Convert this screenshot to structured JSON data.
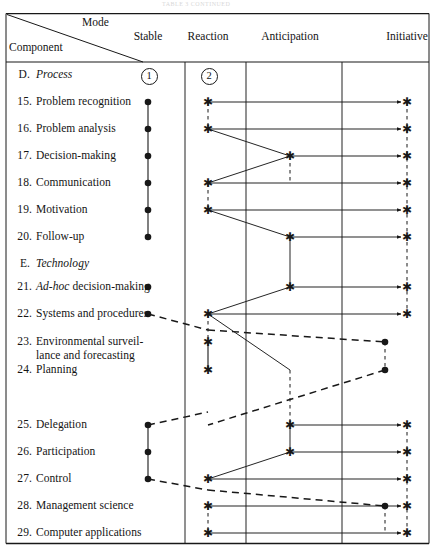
{
  "caption": "TABLE 3   CONTINUED",
  "header": {
    "mode_label": "Mode",
    "component_label": "Component",
    "columns": [
      {
        "id": "stable",
        "label": "Stable",
        "x": 148,
        "divider": 185
      },
      {
        "id": "reaction",
        "label": "Reaction",
        "x": 208,
        "divider": 246
      },
      {
        "id": "anticipation",
        "label": "Anticipation",
        "x": 290,
        "divider": 342
      },
      {
        "id": "initiative",
        "label": "Initiative",
        "x": 407,
        "divider": null
      }
    ],
    "stage_markers": [
      {
        "label": "1",
        "x": 148,
        "y": 75
      },
      {
        "label": "2",
        "x": 208,
        "y": 75
      }
    ]
  },
  "rows": [
    {
      "num": "D.",
      "label": "Process",
      "italic": true,
      "section": true,
      "y": 75
    },
    {
      "num": "15.",
      "label": "Problem recognition",
      "italic": false,
      "section": false,
      "y": 102
    },
    {
      "num": "16.",
      "label": "Problem analysis",
      "italic": false,
      "section": false,
      "y": 129
    },
    {
      "num": "17.",
      "label": "Decision-making",
      "italic": false,
      "section": false,
      "y": 156
    },
    {
      "num": "18.",
      "label": "Communication",
      "italic": false,
      "section": false,
      "y": 183
    },
    {
      "num": "19.",
      "label": "Motivation",
      "italic": false,
      "section": false,
      "y": 210
    },
    {
      "num": "20.",
      "label": "Follow-up",
      "italic": false,
      "section": false,
      "y": 237
    },
    {
      "num": "E.",
      "label": "Technology",
      "italic": true,
      "section": true,
      "y": 264
    },
    {
      "num": "21.",
      "label": "Ad-hoc decision-making",
      "italic_prefix": "Ad-hoc",
      "italic": false,
      "section": false,
      "y": 287
    },
    {
      "num": "22.",
      "label": "Systems and procedures",
      "italic": false,
      "section": false,
      "y": 314
    },
    {
      "num": "23.",
      "label": "Environmental surveil-",
      "label2": "lance and forecasting",
      "italic": false,
      "section": false,
      "y": 342
    },
    {
      "num": "24.",
      "label": "Planning",
      "italic": false,
      "section": false,
      "y": 370
    },
    {
      "num": "25.",
      "label": "Delegation",
      "italic": false,
      "section": false,
      "y": 425
    },
    {
      "num": "26.",
      "label": "Participation",
      "italic": false,
      "section": false,
      "y": 452
    },
    {
      "num": "27.",
      "label": "Control",
      "italic": false,
      "section": false,
      "y": 479
    },
    {
      "num": "28.",
      "label": "Management science",
      "italic": false,
      "section": false,
      "y": 506
    },
    {
      "num": "29.",
      "label": "Computer applications",
      "italic": false,
      "section": false,
      "y": 533
    }
  ],
  "chart_data": {
    "type": "scatter",
    "xlabel": "Mode",
    "ylabel": "Component",
    "categories_x": [
      "Stable",
      "Reaction",
      "Anticipation",
      "Initiative"
    ],
    "x_positions": [
      148,
      208,
      290,
      407
    ],
    "dot_markers": [
      {
        "row": "15.",
        "mode": "Stable",
        "x": 148,
        "y": 102
      },
      {
        "row": "16.",
        "mode": "Stable",
        "x": 148,
        "y": 129
      },
      {
        "row": "17.",
        "mode": "Stable",
        "x": 148,
        "y": 156
      },
      {
        "row": "18.",
        "mode": "Stable",
        "x": 148,
        "y": 183
      },
      {
        "row": "19.",
        "mode": "Stable",
        "x": 148,
        "y": 210
      },
      {
        "row": "20.",
        "mode": "Stable",
        "x": 148,
        "y": 237
      },
      {
        "row": "21.",
        "mode": "Stable",
        "x": 148,
        "y": 287
      },
      {
        "row": "22.",
        "mode": "Stable",
        "x": 148,
        "y": 314
      },
      {
        "row": "23.",
        "mode": "near-Initiative",
        "x": 385,
        "y": 342
      },
      {
        "row": "24.",
        "mode": "near-Initiative",
        "x": 385,
        "y": 370
      },
      {
        "row": "25.",
        "mode": "Stable",
        "x": 148,
        "y": 425
      },
      {
        "row": "26.",
        "mode": "Stable",
        "x": 148,
        "y": 452
      },
      {
        "row": "27.",
        "mode": "Stable",
        "x": 148,
        "y": 479
      },
      {
        "row": "28.",
        "mode": "near-Initiative",
        "x": 385,
        "y": 506
      }
    ],
    "star_markers": [
      {
        "row": "15.",
        "mode": "Reaction",
        "x": 208,
        "y": 102
      },
      {
        "row": "15.",
        "mode": "Initiative",
        "x": 407,
        "y": 102
      },
      {
        "row": "16.",
        "mode": "Reaction",
        "x": 208,
        "y": 129
      },
      {
        "row": "16.",
        "mode": "Initiative",
        "x": 407,
        "y": 129
      },
      {
        "row": "17.",
        "mode": "Anticipation",
        "x": 290,
        "y": 156
      },
      {
        "row": "17.",
        "mode": "Initiative",
        "x": 407,
        "y": 156
      },
      {
        "row": "18.",
        "mode": "Reaction",
        "x": 208,
        "y": 183
      },
      {
        "row": "18.",
        "mode": "Initiative",
        "x": 407,
        "y": 183
      },
      {
        "row": "19.",
        "mode": "Reaction",
        "x": 208,
        "y": 210
      },
      {
        "row": "19.",
        "mode": "Initiative",
        "x": 407,
        "y": 210
      },
      {
        "row": "20.",
        "mode": "Anticipation",
        "x": 290,
        "y": 237
      },
      {
        "row": "20.",
        "mode": "Initiative",
        "x": 407,
        "y": 237
      },
      {
        "row": "21.",
        "mode": "Anticipation",
        "x": 290,
        "y": 287
      },
      {
        "row": "21.",
        "mode": "Initiative",
        "x": 407,
        "y": 287
      },
      {
        "row": "22.",
        "mode": "Reaction",
        "x": 208,
        "y": 314
      },
      {
        "row": "22.",
        "mode": "Initiative",
        "x": 407,
        "y": 314
      },
      {
        "row": "23.",
        "mode": "Reaction",
        "x": 208,
        "y": 342
      },
      {
        "row": "24.",
        "mode": "Reaction",
        "x": 208,
        "y": 370
      },
      {
        "row": "25.",
        "mode": "Anticipation",
        "x": 290,
        "y": 425
      },
      {
        "row": "25.",
        "mode": "Initiative",
        "x": 407,
        "y": 425
      },
      {
        "row": "26.",
        "mode": "Anticipation",
        "x": 290,
        "y": 452
      },
      {
        "row": "26.",
        "mode": "Initiative",
        "x": 407,
        "y": 452
      },
      {
        "row": "27.",
        "mode": "Reaction",
        "x": 208,
        "y": 479
      },
      {
        "row": "27.",
        "mode": "Initiative",
        "x": 407,
        "y": 479
      },
      {
        "row": "28.",
        "mode": "Reaction",
        "x": 208,
        "y": 506
      },
      {
        "row": "28.",
        "mode": "Initiative",
        "x": 407,
        "y": 506
      },
      {
        "row": "29.",
        "mode": "Reaction",
        "x": 208,
        "y": 533
      },
      {
        "row": "29.",
        "mode": "Initiative",
        "x": 407,
        "y": 533
      }
    ],
    "solid_arrows": [
      {
        "from": [
          208,
          102
        ],
        "to": [
          407,
          102
        ]
      },
      {
        "from": [
          208,
          129
        ],
        "to": [
          407,
          129
        ]
      },
      {
        "from": [
          290,
          156
        ],
        "to": [
          407,
          156
        ]
      },
      {
        "from": [
          208,
          183
        ],
        "to": [
          407,
          183
        ]
      },
      {
        "from": [
          208,
          210
        ],
        "to": [
          407,
          210
        ]
      },
      {
        "from": [
          290,
          237
        ],
        "to": [
          407,
          237
        ]
      },
      {
        "from": [
          290,
          287
        ],
        "to": [
          407,
          287
        ]
      },
      {
        "from": [
          208,
          314
        ],
        "to": [
          407,
          314
        ]
      },
      {
        "from": [
          290,
          425
        ],
        "to": [
          407,
          425
        ]
      },
      {
        "from": [
          290,
          452
        ],
        "to": [
          407,
          452
        ]
      },
      {
        "from": [
          208,
          479
        ],
        "to": [
          407,
          479
        ]
      },
      {
        "from": [
          208,
          506
        ],
        "to": [
          407,
          506
        ]
      },
      {
        "from": [
          208,
          533
        ],
        "to": [
          407,
          533
        ]
      }
    ],
    "solid_links": [
      {
        "from": [
          208,
          129
        ],
        "to": [
          290,
          156
        ]
      },
      {
        "from": [
          290,
          156
        ],
        "to": [
          208,
          183
        ]
      },
      {
        "from": [
          208,
          210
        ],
        "to": [
          290,
          237
        ]
      },
      {
        "from": [
          290,
          237
        ],
        "to": [
          290,
          287
        ]
      },
      {
        "from": [
          290,
          287
        ],
        "to": [
          208,
          314
        ]
      },
      {
        "from": [
          208,
          314
        ],
        "to": [
          290,
          370
        ]
      },
      {
        "from": [
          208,
          479
        ],
        "to": [
          290,
          452
        ]
      },
      {
        "from": [
          290,
          452
        ],
        "to": [
          290,
          425
        ]
      }
    ],
    "solid_vlinks": [
      {
        "x": 148,
        "from": 102,
        "to": 237
      },
      {
        "x": 148,
        "from": 425,
        "to": 479
      },
      {
        "x": 208,
        "from": 342,
        "to": 370
      },
      {
        "x": 208,
        "from": 479,
        "to": 479
      }
    ],
    "dashed_vlinks": [
      {
        "x": 208,
        "from": 102,
        "to": 129
      },
      {
        "x": 208,
        "from": 183,
        "to": 210
      },
      {
        "x": 208,
        "from": 314,
        "to": 342
      },
      {
        "x": 208,
        "from": 506,
        "to": 533
      },
      {
        "x": 290,
        "from": 156,
        "to": 183
      },
      {
        "x": 290,
        "from": 370,
        "to": 425
      },
      {
        "x": 385,
        "from": 342,
        "to": 370
      },
      {
        "x": 385,
        "from": 506,
        "to": 533
      },
      {
        "x": 407,
        "from": 102,
        "to": 314
      },
      {
        "x": 407,
        "from": 425,
        "to": 533
      }
    ],
    "dashed_links": [
      {
        "from": [
          148,
          314
        ],
        "to": [
          208,
          330
        ]
      },
      {
        "from": [
          208,
          330
        ],
        "to": [
          385,
          342
        ]
      },
      {
        "from": [
          385,
          370
        ],
        "to": [
          208,
          425
        ]
      },
      {
        "from": [
          148,
          425
        ],
        "to": [
          208,
          412
        ]
      },
      {
        "from": [
          148,
          479
        ],
        "to": [
          208,
          490
        ]
      },
      {
        "from": [
          208,
          490
        ],
        "to": [
          385,
          506
        ]
      }
    ],
    "grid": true,
    "legend_position": "none"
  }
}
